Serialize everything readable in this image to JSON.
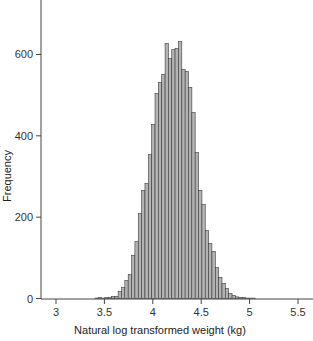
{
  "chart_data": {
    "type": "bar",
    "subtype": "histogram",
    "title": "",
    "xlabel": "Natural log transformed weight (kg)",
    "ylabel": "Frequency",
    "xlim": [
      2.87,
      5.6
    ],
    "ylim": [
      0,
      730
    ],
    "x_ticks": [
      3,
      3.5,
      4,
      4.5,
      5,
      5.5
    ],
    "x_tick_labels": [
      "3",
      "3.5",
      "4",
      "4.5",
      "5",
      "5.5"
    ],
    "y_ticks": [
      0,
      200,
      400,
      600
    ],
    "y_tick_labels": [
      "0",
      "200",
      "400",
      "600"
    ],
    "grid": false,
    "legend": null,
    "bin_width": 0.0346,
    "bins_start": [
      3.4,
      3.435,
      3.469,
      3.504,
      3.538,
      3.573,
      3.608,
      3.642,
      3.677,
      3.711,
      3.746,
      3.781,
      3.815,
      3.85,
      3.884,
      3.919,
      3.954,
      3.988,
      4.023,
      4.057,
      4.092,
      4.127,
      4.161,
      4.196,
      4.23,
      4.265,
      4.3,
      4.334,
      4.369,
      4.403,
      4.438,
      4.473,
      4.507,
      4.542,
      4.576,
      4.611,
      4.646,
      4.68,
      4.715,
      4.749,
      4.784,
      4.819,
      4.853,
      4.888,
      4.922,
      4.957,
      4.992,
      5.026
    ],
    "values": [
      1,
      2,
      1,
      2,
      3,
      5,
      5,
      17,
      27,
      44,
      59,
      106,
      140,
      209,
      266,
      283,
      354,
      428,
      504,
      531,
      551,
      627,
      590,
      612,
      615,
      632,
      563,
      558,
      519,
      457,
      359,
      266,
      231,
      167,
      135,
      116,
      76,
      52,
      37,
      25,
      12,
      7,
      4,
      2,
      2,
      1,
      1,
      1
    ],
    "colors": {
      "bar_fill": "#b3b3b3",
      "bar_edge": "#3a3a3a",
      "axis": "#444444"
    }
  }
}
